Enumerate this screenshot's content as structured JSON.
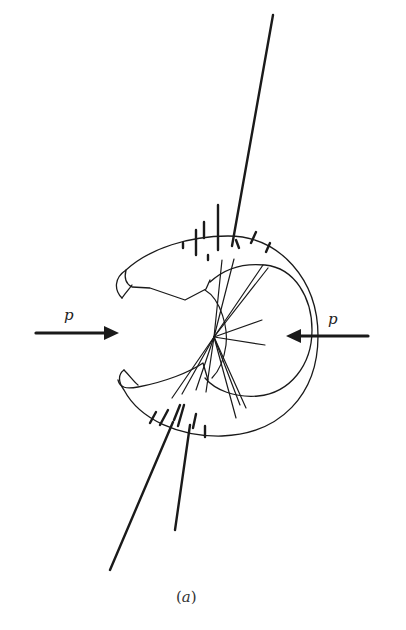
{
  "figure": {
    "caption_open": "(",
    "caption_letter": "a",
    "caption_close": ")",
    "beam_left": {
      "label": "p",
      "direction": "right"
    },
    "beam_right": {
      "label": "p",
      "direction": "left"
    },
    "colors": {
      "ink": "#1a1a1a",
      "background": "#ffffff"
    }
  }
}
